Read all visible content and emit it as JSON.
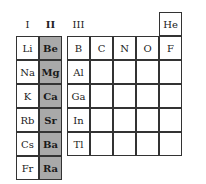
{
  "headers": {
    "group1": "I",
    "group2": "II",
    "group3": "III"
  },
  "colors": {
    "highlight": "#a9a9a9",
    "border": "#333333",
    "background": "#ffffff"
  },
  "group1": [
    "Li",
    "Na",
    "K",
    "Rb",
    "Cs",
    "Fr"
  ],
  "group2": [
    "Be",
    "Mg",
    "Ca",
    "Sr",
    "Ba",
    "Ra"
  ],
  "p_block": {
    "row0": {
      "he": "He"
    },
    "row1": [
      "B",
      "C",
      "N",
      "O",
      "F",
      "Ne"
    ],
    "row2": [
      "Al",
      "",
      "",
      "",
      "",
      ""
    ],
    "row3": [
      "Ga",
      "",
      "",
      "",
      "",
      ""
    ],
    "row4": [
      "In",
      "",
      "",
      "",
      "",
      ""
    ],
    "row5": [
      "Tl",
      "",
      "",
      "",
      "",
      ""
    ]
  }
}
